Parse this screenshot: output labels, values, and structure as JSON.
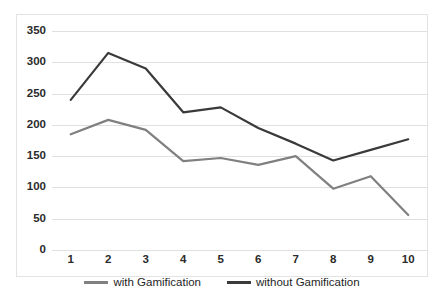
{
  "chart_data": {
    "type": "line",
    "title": "",
    "xlabel": "",
    "ylabel": "",
    "categories": [
      "1",
      "2",
      "3",
      "4",
      "5",
      "6",
      "7",
      "8",
      "9",
      "10"
    ],
    "ylim": [
      0,
      350
    ],
    "yticks": [
      0,
      50,
      100,
      150,
      200,
      250,
      300,
      350
    ],
    "ytick_labels": [
      "0",
      "50",
      "100",
      "150",
      "200",
      "250",
      "300",
      "350"
    ],
    "grid": true,
    "legend_position": "bottom",
    "series": [
      {
        "name": "with Gamification",
        "color": "#808080",
        "values": [
          185,
          208,
          192,
          142,
          147,
          136,
          150,
          98,
          118,
          56
        ]
      },
      {
        "name": "without Gamification",
        "color": "#3a3a3a",
        "values": [
          240,
          315,
          290,
          220,
          228,
          195,
          170,
          143,
          160,
          177
        ]
      }
    ]
  },
  "legend": {
    "items": [
      {
        "label": "with Gamification",
        "color": "#808080"
      },
      {
        "label": "without Gamification",
        "color": "#3a3a3a"
      }
    ]
  },
  "colors": {
    "grid": "#e0e0e0",
    "border": "#e3e3e3",
    "text": "#2b2b2b"
  }
}
